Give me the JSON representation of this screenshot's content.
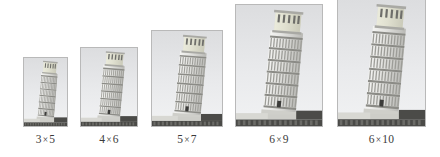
{
  "figure": {
    "kind": "photo-size-comparison",
    "background_color": "#ffffff",
    "label_color": "#3a3a3a",
    "frame_border_color": "#b9b9b9"
  },
  "photos": [
    {
      "id": "photo-3x5",
      "label": "3×5",
      "label_left": "3",
      "label_right": "5",
      "width_px": 45,
      "height_px": 70,
      "left_px": 23,
      "bottom_px": 30,
      "alt": "Leaning Tower of Pisa, grayscale photo, 3 by 5 print size"
    },
    {
      "id": "photo-4x6",
      "label": "4×6",
      "label_left": "4",
      "label_right": "6",
      "width_px": 58,
      "height_px": 80,
      "left_px": 80,
      "bottom_px": 30,
      "alt": "Leaning Tower of Pisa, grayscale photo, 4 by 6 print size"
    },
    {
      "id": "photo-5x7",
      "label": "5×7",
      "label_left": "5",
      "label_right": "7",
      "width_px": 72,
      "height_px": 97,
      "left_px": 151,
      "bottom_px": 30,
      "alt": "Leaning Tower of Pisa, grayscale photo, 5 by 7 print size"
    },
    {
      "id": "photo-6x9",
      "label": "6×9",
      "label_left": "6",
      "label_right": "9",
      "width_px": 88,
      "height_px": 123,
      "left_px": 235,
      "bottom_px": 30,
      "alt": "Leaning Tower of Pisa, grayscale photo, 6 by 9 print size"
    },
    {
      "id": "photo-6x10",
      "label": "6×10",
      "label_left": "6",
      "label_right": "10",
      "width_px": 89,
      "height_px": 129,
      "left_px": 337,
      "bottom_px": 30,
      "alt": "Leaning Tower of Pisa, grayscale photo, 6 by 10 print size"
    }
  ]
}
